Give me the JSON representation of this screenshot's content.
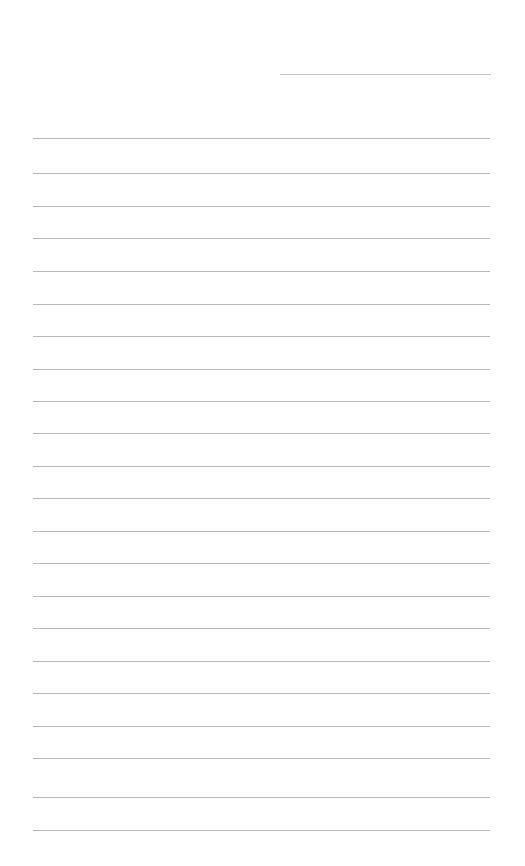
{
  "page": {
    "width": 525,
    "height": 866,
    "background": "#ffffff"
  },
  "header_line": {
    "x1": 280,
    "x2": 491,
    "y": 74,
    "color": "#c4c4c4"
  },
  "rules": {
    "x1": 33,
    "x2": 490,
    "color": "#b8b8b8",
    "y_positions": [
      138,
      173,
      206,
      238,
      271,
      304,
      336,
      369,
      401,
      433,
      466,
      498,
      531,
      563,
      596,
      628,
      661,
      693,
      726,
      758,
      797,
      830
    ]
  }
}
